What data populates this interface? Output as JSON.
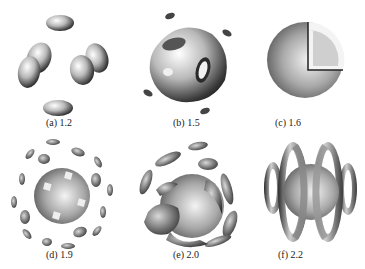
{
  "figure": {
    "panels": [
      {
        "id": "a",
        "label": "(a) 1.2"
      },
      {
        "id": "b",
        "label": "(b) 1.5"
      },
      {
        "id": "c",
        "label": "(c) 1.6"
      },
      {
        "id": "d",
        "label": "(d) 1.9"
      },
      {
        "id": "e",
        "label": "(e) 2.0"
      },
      {
        "id": "f",
        "label": "(f) 2.2"
      }
    ]
  }
}
